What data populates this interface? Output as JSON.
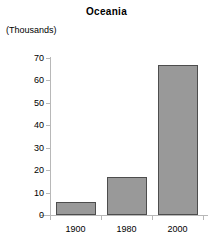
{
  "chart_data": {
    "type": "bar",
    "title": "Oceania",
    "xlabel": "",
    "ylabel": "(Thousands)",
    "categories": [
      "1900",
      "1980",
      "2000"
    ],
    "values": [
      6,
      17,
      67
    ],
    "ylim": [
      0,
      70
    ],
    "ytick_labels": [
      "0",
      "10",
      "20",
      "30",
      "40",
      "50",
      "60",
      "70"
    ],
    "ytick_values": [
      0,
      10,
      20,
      30,
      40,
      50,
      60,
      70
    ],
    "grid": false,
    "legend": "none",
    "series": [
      {
        "name": "Oceania",
        "values": [
          6,
          17,
          67
        ]
      }
    ],
    "colors": {
      "bar_fill": "#999999",
      "bar_border": "#4d4d4d",
      "axis": "#b8b8b8",
      "text": "#000000",
      "background": "#ffffff"
    }
  }
}
